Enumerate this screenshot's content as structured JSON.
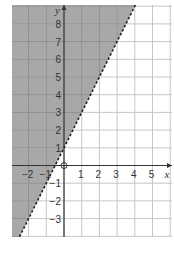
{
  "chart_data": {
    "type": "inequality-graph",
    "title": "",
    "xlabel": "x",
    "ylabel": "y",
    "xlim": [
      -3,
      6
    ],
    "ylim": [
      -4,
      9
    ],
    "grid": true,
    "origin_label": "O",
    "x_ticks": [
      "-2",
      "-1",
      "1",
      "2",
      "3",
      "4",
      "5"
    ],
    "x_tick_values": [
      -2,
      -1,
      1,
      2,
      3,
      4,
      5
    ],
    "y_ticks": [
      "8",
      "7",
      "6",
      "5",
      "4",
      "3",
      "2",
      "1",
      "-1",
      "-2",
      "-3"
    ],
    "y_tick_values": [
      8,
      7,
      6,
      5,
      4,
      3,
      2,
      1,
      -1,
      -2,
      -3
    ],
    "boundary_line": {
      "equation": "y = 2x + 1",
      "slope": 2,
      "intercept": 1,
      "style": "dashed"
    },
    "shaded_region": {
      "inequality": "y > 2x + 1",
      "side": "above-left"
    },
    "colors": {
      "shade": "#a8a8a8",
      "grid_shaded": "#8c8c8c",
      "grid": "#c6c6c6",
      "axis": "#333333",
      "line": "#222222"
    }
  }
}
